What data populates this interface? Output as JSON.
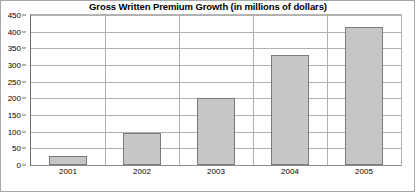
{
  "chart_data": {
    "type": "bar",
    "title": "Gross Written Premium Growth (in millions of dollars)",
    "xlabel": "",
    "ylabel": "",
    "categories": [
      "2001",
      "2002",
      "2003",
      "2004",
      "2005"
    ],
    "values": [
      28,
      95,
      200,
      330,
      415
    ],
    "series": [
      {
        "name": "Gross Written Premium",
        "values": [
          28,
          95,
          200,
          330,
          415
        ]
      }
    ],
    "ylim": [
      0,
      450
    ],
    "ytick_step": 50,
    "ytick_labels": [
      "0",
      "50",
      "100",
      "150",
      "200",
      "250",
      "300",
      "350",
      "400",
      "450"
    ],
    "ytick_values": [
      0,
      50,
      100,
      150,
      200,
      250,
      300,
      350,
      400,
      450
    ],
    "grid": true,
    "grid_axis": "y",
    "legend": false,
    "legend_position": "none",
    "bar_fill_color": "#c6c6c6",
    "bar_border_color": "#7a7a7a",
    "gridline_color": "#b0b0b0",
    "axis_color": "#6e6e6e",
    "background_color": "#ffffff",
    "text_color": "#000000"
  }
}
